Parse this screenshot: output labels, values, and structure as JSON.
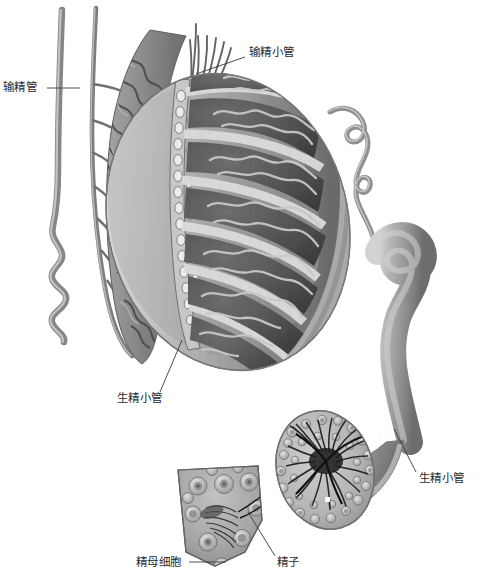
{
  "figure": {
    "background_color": "#ffffff",
    "width": 481,
    "height": 582,
    "style": "grayscale medical illustration"
  },
  "palette": {
    "ink": "#2b2b2b",
    "leader_line": "#3a3a3a",
    "tunica_light": "#d9d9d9",
    "tunica_mid": "#b3b3b3",
    "tunica_dark": "#8f8f8f",
    "lobule_dark": "#5c5c5c",
    "lobule_darker": "#444444",
    "tubule_pale": "#cfcfcf",
    "duct_gray": "#9a9a9a",
    "duct_gray_dark": "#6f6f6f",
    "epididymis_gray": "#8a8a8a",
    "cell_ring": "#c9c9c9",
    "cell_core": "#7d7d7d",
    "sperm_black": "#1e1e1e"
  },
  "labels": [
    {
      "id": "vas-deferens",
      "text": "输精管",
      "meaning": "vas deferens",
      "text_x": 3,
      "text_y": 81,
      "leader": {
        "x1": 47,
        "y1": 88,
        "x2": 80,
        "y2": 88
      }
    },
    {
      "id": "efferent-ductules",
      "text": "输精小管",
      "meaning": "efferent ductules",
      "text_x": 249,
      "text_y": 46,
      "leader": {
        "x1": 245,
        "y1": 57,
        "x2": 196,
        "y2": 74
      }
    },
    {
      "id": "seminiferous-tubule-left",
      "text": "生精小管",
      "meaning": "seminiferous tubule",
      "text_x": 117,
      "text_y": 392,
      "leader": {
        "x1": 160,
        "y1": 392,
        "x2": 182,
        "y2": 340
      }
    },
    {
      "id": "seminiferous-tubule-right",
      "text": "生精小管",
      "meaning": "seminiferous tubule",
      "text_x": 419,
      "text_y": 472,
      "leader": {
        "x1": 416,
        "y1": 472,
        "x2": 394,
        "y2": 429
      }
    },
    {
      "id": "spermatocyte",
      "text": "精母细胞",
      "meaning": "spermatocyte",
      "text_x": 136,
      "text_y": 556,
      "leader": {
        "x1": 189,
        "y1": 562,
        "x2": 226,
        "y2": 562
      }
    },
    {
      "id": "spermatozoa",
      "text": "精子",
      "meaning": "spermatozoa",
      "text_x": 277,
      "text_y": 556,
      "leader": {
        "x1": 275,
        "y1": 556,
        "x2": 248,
        "y2": 512
      }
    }
  ],
  "structures": [
    {
      "id": "vas-deferens-tube",
      "name": "输精管",
      "description": "长直管，下端呈螺旋状盘曲"
    },
    {
      "id": "epididymis",
      "name": "附睾",
      "description": "高度盘曲的管状团块，沿睾丸后缘呈弓形"
    },
    {
      "id": "efferent-ductules-fan",
      "name": "输精小管",
      "description": "自睾丸网呈扇形发出的细管"
    },
    {
      "id": "rete-testis",
      "name": "睾丸网",
      "description": "网状小腔，位于睾丸纵隔"
    },
    {
      "id": "testis-section",
      "name": "睾丸切面",
      "description": "卵圆形切面，被小隔分成放射状小叶",
      "lobule_count": 7
    },
    {
      "id": "seminiferous-tubule-magnified",
      "name": "生精小管（放大）",
      "description": "从睾丸引出并放大的弯曲小管"
    },
    {
      "id": "tubule-cross-section",
      "name": "生精小管横切面",
      "description": "管壁内多层生精细胞，管腔内有精子"
    },
    {
      "id": "wall-wedge-detail",
      "name": "管壁楔形放大",
      "description": "示生精细胞与精子"
    }
  ]
}
